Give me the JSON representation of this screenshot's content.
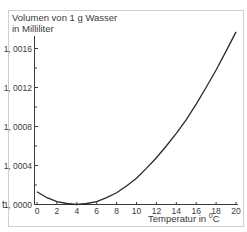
{
  "chart_data": {
    "type": "line",
    "title": "Volumen von 1 g Wasser in Milliliter",
    "ylabel_line1": "Volumen von 1 g Wasser",
    "ylabel_line2": "in Milliliter",
    "xlabel": "Temperatur in °C",
    "xlabel_prefix": "Temperatur in ",
    "xlabel_unit_sup": "0",
    "xlabel_unit": "C",
    "side_label": "t",
    "xlim": [
      0,
      20
    ],
    "ylim": [
      1.0,
      1.0018
    ],
    "x_ticks": [
      0,
      2,
      4,
      6,
      8,
      10,
      12,
      14,
      16,
      18,
      20
    ],
    "x_tick_labels": [
      "0",
      "2",
      "4",
      "6",
      "8",
      "10",
      "12",
      "14",
      "16",
      "18",
      "20"
    ],
    "y_ticks": [
      1.0,
      1.0004,
      1.0008,
      1.0012,
      1.0016
    ],
    "y_tick_labels": [
      "1, 0000",
      "1, 0004",
      "1, 0008",
      "1, 0012",
      "1, 0016"
    ],
    "grid": false,
    "series": [
      {
        "name": "Volumen",
        "x": [
          0,
          1,
          2,
          3,
          4,
          5,
          6,
          7,
          8,
          9,
          10,
          11,
          12,
          13,
          14,
          15,
          16,
          17,
          18,
          19,
          20
        ],
        "values": [
          1.00013,
          1.00007,
          1.00003,
          1.00001,
          1.0,
          1.00001,
          1.00003,
          1.00007,
          1.00012,
          1.00019,
          1.00027,
          1.00037,
          1.00048,
          1.0006,
          1.00073,
          1.00087,
          1.00103,
          1.0012,
          1.00138,
          1.00157,
          1.00177
        ]
      }
    ],
    "colors": {
      "line": "#2a2a2a",
      "axis": "#3a3a3a",
      "frame": "#cfcfcf"
    }
  }
}
